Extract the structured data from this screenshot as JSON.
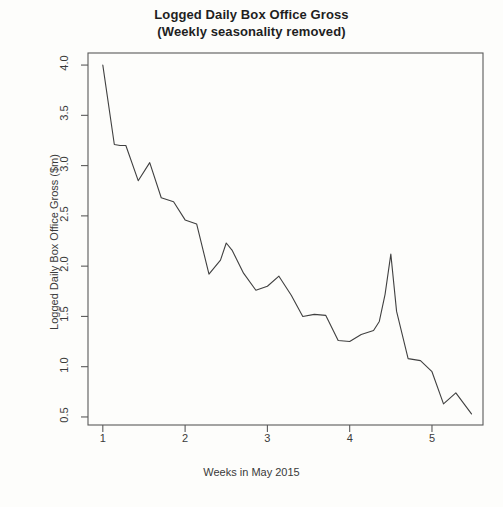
{
  "chart_data": {
    "type": "line",
    "title": "Logged Daily Box Office Gross",
    "subtitle": "(Weekly seasonality removed)",
    "xlabel": "Weeks in May 2015",
    "ylabel": "Logged Daily Box Office Gross ($m)",
    "xlim": [
      0.82,
      5.62
    ],
    "ylim": [
      0.42,
      4.12
    ],
    "xticks": [
      1,
      2,
      3,
      4,
      5
    ],
    "xtick_labels": [
      "1",
      "2",
      "3",
      "4",
      "5"
    ],
    "yticks": [
      0.5,
      1.0,
      1.5,
      2.0,
      2.5,
      3.0,
      3.5,
      4.0
    ],
    "ytick_labels": [
      "0.5",
      "1.0",
      "1.5",
      "2.0",
      "2.5",
      "3.0",
      "3.5",
      "4.0"
    ],
    "grid": false,
    "legend": null,
    "line_color": "#404040",
    "background_color": "#fdfdfb",
    "series": [
      {
        "name": "Logged daily box office gross",
        "x": [
          1.0,
          1.14,
          1.21,
          1.28,
          1.43,
          1.57,
          1.71,
          1.86,
          2.0,
          2.14,
          2.29,
          2.43,
          2.5,
          2.57,
          2.71,
          2.86,
          3.0,
          3.14,
          3.29,
          3.43,
          3.57,
          3.71,
          3.86,
          4.0,
          4.14,
          4.29,
          4.36,
          4.43,
          4.5,
          4.57,
          4.71,
          4.86,
          5.0,
          5.14,
          5.29,
          5.48
        ],
        "y": [
          4.0,
          3.21,
          3.2,
          3.2,
          2.85,
          3.03,
          2.68,
          2.64,
          2.46,
          2.42,
          1.92,
          2.06,
          2.23,
          2.16,
          1.93,
          1.76,
          1.8,
          1.9,
          1.71,
          1.5,
          1.52,
          1.51,
          1.26,
          1.25,
          1.32,
          1.36,
          1.45,
          1.72,
          2.12,
          1.55,
          1.08,
          1.06,
          0.95,
          0.63,
          0.74,
          0.53
        ]
      }
    ]
  }
}
